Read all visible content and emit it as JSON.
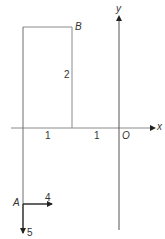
{
  "diagram": {
    "title": "",
    "colors": {
      "line": "#8a8a8a",
      "axis": "#555555",
      "arrow": "#222222",
      "text": "#333333",
      "background": "#ffffff"
    },
    "axes": {
      "x_label": "x",
      "y_label": "y",
      "origin_label": "O",
      "x_ticks": [
        {
          "label": "1",
          "between": "-2 and -1"
        },
        {
          "label": "1",
          "between": "-1 and 0"
        }
      ]
    },
    "rectangle": {
      "corner_label": "B",
      "height_label": "2",
      "x_from": -2,
      "x_to": -1,
      "height": 2
    },
    "point_A": {
      "label": "A",
      "vector_right_label": "4",
      "vector_down_label": "5"
    }
  }
}
